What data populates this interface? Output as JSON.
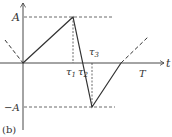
{
  "figure": {
    "caption": "(b)",
    "labels": {
      "amplitude_pos": "A",
      "amplitude_neg": "−A",
      "time_axis": "t",
      "period": "T",
      "tau1": "τ",
      "tau1_sub": "1",
      "tau2": "τ",
      "tau2_sub": "2",
      "tau3": "τ",
      "tau3_sub": "3"
    },
    "colors": {
      "line": "#333333",
      "dashed": "#444444",
      "background": "#ffffff"
    },
    "waveform": {
      "description": "Piecewise-linear waveform: ramp from 0 to A at tau1, drop to zero at tau2, continue to -A at tau3, ramp back to 0 at T, periodic continuation dashed",
      "points": [
        {
          "t": "0",
          "y": "0"
        },
        {
          "t": "τ1",
          "y": "A"
        },
        {
          "t": "τ2",
          "y": "0"
        },
        {
          "t": "τ3",
          "y": "-A"
        },
        {
          "t": "T",
          "y": "0"
        }
      ]
    }
  }
}
